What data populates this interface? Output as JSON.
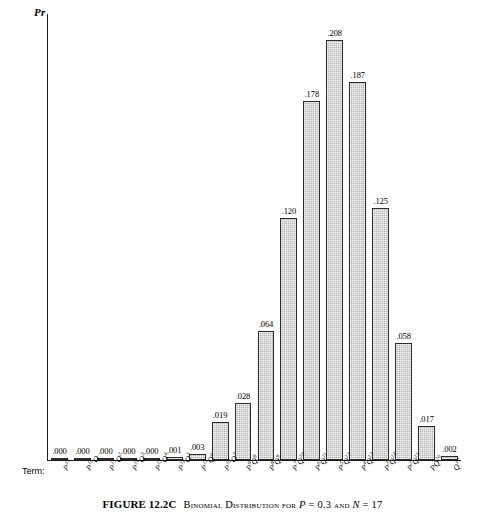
{
  "axis": {
    "y_label": "Pr",
    "term_axis_label": "Term:"
  },
  "caption": {
    "figure_number": "FIGURE 12.2C",
    "text_before_p": "Binomial Distribution for ",
    "p_symbol": "P",
    "p_value": " = 0.3 ",
    "and_word": "and ",
    "n_symbol": "N",
    "n_value": " = 17",
    "full_text": "FIGURE 12.2C   Binomial Distribution for P = 0.3 and N = 17"
  },
  "chart_data": {
    "type": "bar",
    "title": "Binomial Distribution for P = 0.3 and N = 17",
    "xlabel": "Term:",
    "ylabel": "Pr",
    "ylim": [
      0,
      0.208
    ],
    "grid": false,
    "legend": null,
    "categories": [
      "P^17",
      "P^16Q",
      "P^15Q^2",
      "P^14Q^3",
      "P^13Q^4",
      "P^12Q^5",
      "P^11Q^6",
      "P^10Q^7",
      "P^9Q^8",
      "P^8Q^9",
      "P^7Q^10",
      "P^6Q^11",
      "P^5Q^12",
      "P^4Q^13",
      "P^3Q^14",
      "P^2Q^15",
      "PQ^16",
      "Q^17"
    ],
    "values": [
      0.0,
      0.0,
      0.0,
      0.0,
      0.0,
      0.001,
      0.003,
      0.019,
      0.028,
      0.064,
      0.12,
      0.178,
      0.208,
      0.187,
      0.125,
      0.058,
      0.017,
      0.002
    ],
    "value_labels": [
      ".000",
      ".000",
      ".000",
      ".000",
      ".000",
      ".001",
      ".003",
      ".019",
      ".028",
      ".064",
      ".120",
      ".178",
      ".208",
      ".187",
      ".125",
      ".058",
      ".017",
      ".002"
    ]
  },
  "terms": [
    {
      "base": "P",
      "base_exp": "17",
      "second": "",
      "second_exp": ""
    },
    {
      "base": "P",
      "base_exp": "16",
      "second": "Q",
      "second_exp": ""
    },
    {
      "base": "P",
      "base_exp": "15",
      "second": "Q",
      "second_exp": "2"
    },
    {
      "base": "P",
      "base_exp": "14",
      "second": "Q",
      "second_exp": "3"
    },
    {
      "base": "P",
      "base_exp": "13",
      "second": "Q",
      "second_exp": "4"
    },
    {
      "base": "P",
      "base_exp": "12",
      "second": "Q",
      "second_exp": "5"
    },
    {
      "base": "P",
      "base_exp": "11",
      "second": "Q",
      "second_exp": "6"
    },
    {
      "base": "P",
      "base_exp": "10",
      "second": "Q",
      "second_exp": "7"
    },
    {
      "base": "P",
      "base_exp": "9",
      "second": "Q",
      "second_exp": "8"
    },
    {
      "base": "P",
      "base_exp": "8",
      "second": "Q",
      "second_exp": "9"
    },
    {
      "base": "P",
      "base_exp": "7",
      "second": "Q",
      "second_exp": "10"
    },
    {
      "base": "P",
      "base_exp": "6",
      "second": "Q",
      "second_exp": "11"
    },
    {
      "base": "P",
      "base_exp": "5",
      "second": "Q",
      "second_exp": "12"
    },
    {
      "base": "P",
      "base_exp": "4",
      "second": "Q",
      "second_exp": "13"
    },
    {
      "base": "P",
      "base_exp": "3",
      "second": "Q",
      "second_exp": "14"
    },
    {
      "base": "P",
      "base_exp": "2",
      "second": "Q",
      "second_exp": "15"
    },
    {
      "base": "P",
      "base_exp": "",
      "second": "Q",
      "second_exp": "16"
    },
    {
      "base": "Q",
      "base_exp": "17",
      "second": "",
      "second_exp": ""
    }
  ],
  "colors": {
    "bar_fill": "#b6b6b6",
    "bar_border": "#2b2b2b",
    "axis": "#1a1a1a",
    "text": "#000000",
    "background": "#ffffff"
  }
}
